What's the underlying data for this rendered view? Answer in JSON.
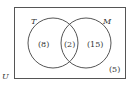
{
  "diagram": {
    "type": "venn",
    "universe_label": "U",
    "sets": [
      {
        "label": "T",
        "only_count": "(8)"
      },
      {
        "label": "M",
        "only_count": "(15)"
      }
    ],
    "intersection_count": "(2)",
    "outside_count": "(5)",
    "colors": {
      "stroke": "#555555",
      "text": "#333333",
      "background": "#ffffff"
    }
  }
}
